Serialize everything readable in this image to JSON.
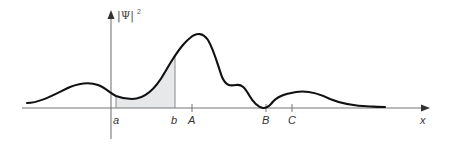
{
  "diagram": {
    "type": "probability-density-plot",
    "y_axis_label": "|Ψ|",
    "y_axis_exponent": "2",
    "x_axis_label": "x",
    "colors": {
      "curve": "#111111",
      "axis": "#777777",
      "shading": "#e6e8ea",
      "text": "#333333"
    },
    "shaded_region": {
      "from": "a",
      "to": "b"
    },
    "markers": [
      {
        "label": "a",
        "description": "left bound of shaded region"
      },
      {
        "label": "b",
        "description": "right bound of shaded region"
      },
      {
        "label": "A",
        "description": "near global maximum of |Ψ|²"
      },
      {
        "label": "B",
        "description": "node where |Ψ|² = 0"
      },
      {
        "label": "C",
        "description": "point on secondary hump"
      }
    ]
  }
}
